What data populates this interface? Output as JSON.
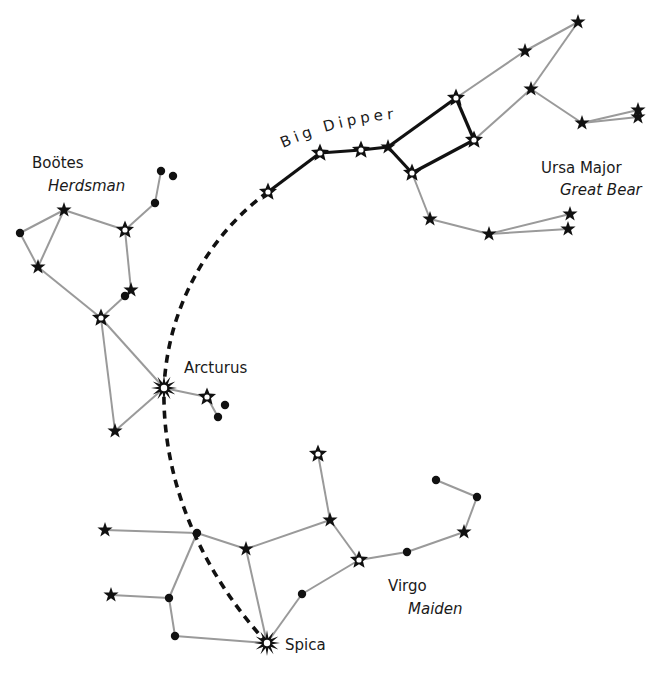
{
  "labels": {
    "big_dipper": "Big Dipper",
    "ursa_major": "Ursa Major",
    "ursa_major_common": "Great Bear",
    "bootes": "Boötes",
    "bootes_common": "Herdsman",
    "arcturus": "Arcturus",
    "virgo": "Virgo",
    "virgo_common": "Maiden",
    "spica": "Spica"
  },
  "colors": {
    "line": "#9a9a9a",
    "asterism": "#111111",
    "star": "#111111",
    "background": "#ffffff"
  },
  "constellations": {
    "ursa_major": {
      "stars": [
        {
          "id": "alkaid",
          "x": 268,
          "y": 192,
          "type": "hollow"
        },
        {
          "id": "mizar",
          "x": 320,
          "y": 153,
          "type": "hollow"
        },
        {
          "id": "alioth",
          "x": 361,
          "y": 150,
          "type": "hollow"
        },
        {
          "id": "megrez",
          "x": 388,
          "y": 147,
          "type": "star"
        },
        {
          "id": "dubhe",
          "x": 456,
          "y": 98,
          "type": "hollow"
        },
        {
          "id": "merak",
          "x": 474,
          "y": 140,
          "type": "hollow"
        },
        {
          "id": "phecda",
          "x": 412,
          "y": 173,
          "type": "hollow"
        },
        {
          "id": "u1",
          "x": 525,
          "y": 51,
          "type": "star"
        },
        {
          "id": "u2",
          "x": 578,
          "y": 22,
          "type": "star"
        },
        {
          "id": "u3",
          "x": 531,
          "y": 89,
          "type": "star"
        },
        {
          "id": "u4",
          "x": 582,
          "y": 123,
          "type": "star"
        },
        {
          "id": "u5",
          "x": 638,
          "y": 110,
          "type": "star"
        },
        {
          "id": "u6",
          "x": 638,
          "y": 117,
          "type": "star"
        },
        {
          "id": "u7",
          "x": 430,
          "y": 219,
          "type": "star"
        },
        {
          "id": "u8",
          "x": 489,
          "y": 234,
          "type": "star"
        },
        {
          "id": "u9",
          "x": 570,
          "y": 214,
          "type": "star"
        },
        {
          "id": "u10",
          "x": 568,
          "y": 229,
          "type": "star"
        }
      ],
      "bold_lines": [
        [
          268,
          192,
          320,
          153
        ],
        [
          320,
          153,
          361,
          150
        ],
        [
          361,
          150,
          388,
          147
        ],
        [
          388,
          147,
          456,
          98
        ],
        [
          456,
          98,
          474,
          140
        ],
        [
          474,
          140,
          412,
          173
        ],
        [
          412,
          173,
          388,
          147
        ]
      ],
      "lines": [
        [
          456,
          98,
          525,
          51
        ],
        [
          525,
          51,
          578,
          22
        ],
        [
          578,
          22,
          531,
          89
        ],
        [
          474,
          140,
          531,
          89
        ],
        [
          531,
          89,
          582,
          123
        ],
        [
          582,
          123,
          638,
          110
        ],
        [
          582,
          123,
          638,
          117
        ],
        [
          412,
          173,
          430,
          219
        ],
        [
          430,
          219,
          489,
          234
        ],
        [
          489,
          234,
          570,
          214
        ],
        [
          489,
          234,
          568,
          229
        ]
      ]
    },
    "bootes": {
      "stars": [
        {
          "id": "b_dot1",
          "x": 20,
          "y": 233,
          "type": "dot"
        },
        {
          "id": "b1",
          "x": 64,
          "y": 210,
          "type": "star"
        },
        {
          "id": "b2",
          "x": 38,
          "y": 267,
          "type": "star"
        },
        {
          "id": "b3",
          "x": 125,
          "y": 230,
          "type": "hollow"
        },
        {
          "id": "b_dot2",
          "x": 155,
          "y": 203,
          "type": "dot"
        },
        {
          "id": "b_dot3",
          "x": 161,
          "y": 171,
          "type": "dot"
        },
        {
          "id": "b_dot4",
          "x": 173,
          "y": 176,
          "type": "dot"
        },
        {
          "id": "b4",
          "x": 131,
          "y": 290,
          "type": "star"
        },
        {
          "id": "b_dot5",
          "x": 125,
          "y": 296,
          "type": "dot"
        },
        {
          "id": "b5",
          "x": 101,
          "y": 318,
          "type": "hollow"
        },
        {
          "id": "arcturus",
          "x": 164,
          "y": 388,
          "type": "burst"
        },
        {
          "id": "b6",
          "x": 207,
          "y": 397,
          "type": "hollow"
        },
        {
          "id": "b_dot6",
          "x": 225,
          "y": 405,
          "type": "dot"
        },
        {
          "id": "b_dot7",
          "x": 218,
          "y": 417,
          "type": "dot"
        },
        {
          "id": "b7",
          "x": 115,
          "y": 431,
          "type": "star"
        }
      ],
      "lines": [
        [
          20,
          233,
          64,
          210
        ],
        [
          20,
          233,
          38,
          267
        ],
        [
          38,
          267,
          64,
          210
        ],
        [
          64,
          210,
          125,
          230
        ],
        [
          125,
          230,
          155,
          203
        ],
        [
          155,
          203,
          161,
          171
        ],
        [
          125,
          230,
          131,
          290
        ],
        [
          38,
          267,
          101,
          318
        ],
        [
          101,
          318,
          125,
          296
        ],
        [
          101,
          318,
          164,
          388
        ],
        [
          101,
          318,
          115,
          431
        ],
        [
          115,
          431,
          164,
          388
        ],
        [
          164,
          388,
          207,
          397
        ],
        [
          207,
          397,
          218,
          417
        ]
      ]
    },
    "virgo": {
      "stars": [
        {
          "id": "v1",
          "x": 105,
          "y": 530,
          "type": "star"
        },
        {
          "id": "v_dot1",
          "x": 197,
          "y": 533,
          "type": "dot"
        },
        {
          "id": "v2",
          "x": 246,
          "y": 549,
          "type": "star"
        },
        {
          "id": "v3",
          "x": 111,
          "y": 595,
          "type": "star"
        },
        {
          "id": "v_dot2",
          "x": 169,
          "y": 598,
          "type": "dot"
        },
        {
          "id": "v_dot3",
          "x": 175,
          "y": 636,
          "type": "dot"
        },
        {
          "id": "spica",
          "x": 267,
          "y": 643,
          "type": "burst"
        },
        {
          "id": "v4",
          "x": 318,
          "y": 454,
          "type": "hollow"
        },
        {
          "id": "v5",
          "x": 330,
          "y": 520,
          "type": "star"
        },
        {
          "id": "v6",
          "x": 359,
          "y": 560,
          "type": "hollow"
        },
        {
          "id": "v_dot4",
          "x": 407,
          "y": 552,
          "type": "dot"
        },
        {
          "id": "v7",
          "x": 464,
          "y": 532,
          "type": "star"
        },
        {
          "id": "v_dot5",
          "x": 477,
          "y": 497,
          "type": "dot"
        },
        {
          "id": "v_dot6",
          "x": 436,
          "y": 480,
          "type": "dot"
        },
        {
          "id": "v_dot7",
          "x": 302,
          "y": 594,
          "type": "dot"
        }
      ],
      "lines": [
        [
          105,
          530,
          197,
          533
        ],
        [
          197,
          533,
          246,
          549
        ],
        [
          246,
          549,
          330,
          520
        ],
        [
          330,
          520,
          318,
          454
        ],
        [
          330,
          520,
          359,
          560
        ],
        [
          359,
          560,
          407,
          552
        ],
        [
          407,
          552,
          464,
          532
        ],
        [
          464,
          532,
          477,
          497
        ],
        [
          477,
          497,
          436,
          480
        ],
        [
          359,
          560,
          302,
          594
        ],
        [
          302,
          594,
          267,
          643
        ],
        [
          246,
          549,
          267,
          643
        ],
        [
          197,
          533,
          169,
          598
        ],
        [
          111,
          595,
          169,
          598
        ],
        [
          169,
          598,
          175,
          636
        ],
        [
          175,
          636,
          267,
          643
        ]
      ]
    }
  },
  "guide_arc": {
    "path": "M268,192 C215,230 168,300 164,388 C162,480 200,570 267,643"
  },
  "text_positions": {
    "bootes": {
      "x": 32,
      "y": 168
    },
    "bootes_common": {
      "x": 48,
      "y": 191
    },
    "ursa_major": {
      "x": 541,
      "y": 173
    },
    "ursa_major_common": {
      "x": 560,
      "y": 195
    },
    "arcturus": {
      "x": 184,
      "y": 373
    },
    "virgo": {
      "x": 388,
      "y": 591
    },
    "virgo_common": {
      "x": 408,
      "y": 614
    },
    "spica": {
      "x": 285,
      "y": 650
    }
  }
}
